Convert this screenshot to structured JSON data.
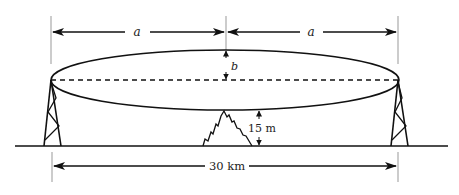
{
  "diagram": {
    "type": "microwave-link-fresnel-zone",
    "labels": {
      "half_span_left": "a",
      "half_span_right": "a",
      "semi_minor_axis": "b",
      "clearance": "15 m",
      "total_distance": "30 km"
    },
    "elements": [
      "left-tower",
      "right-tower",
      "fresnel-ellipse",
      "line-of-sight",
      "mountain-obstacle",
      "ground-line"
    ],
    "colors": {
      "stroke": "#111111",
      "guide": "#999999",
      "background": "#ffffff"
    }
  }
}
